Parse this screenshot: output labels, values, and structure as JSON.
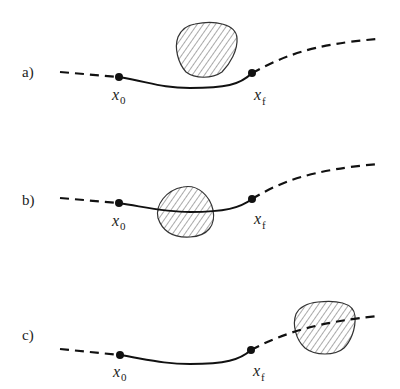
{
  "figure": {
    "panels": [
      {
        "label": "a)",
        "start_symbol": "x",
        "start_subscript": "0",
        "end_symbol": "x",
        "end_subscript": "f",
        "obstacle_position": "above segment, not intersecting"
      },
      {
        "label": "b)",
        "start_symbol": "x",
        "start_subscript": "0",
        "end_symbol": "x",
        "end_subscript": "f",
        "obstacle_position": "intersecting solid segment between x0 and xf"
      },
      {
        "label": "c)",
        "start_symbol": "x",
        "start_subscript": "0",
        "end_symbol": "x",
        "end_subscript": "f",
        "obstacle_position": "intersecting dashed continuation beyond xf"
      }
    ],
    "colors": {
      "line": "#111111",
      "obstacle_outline": "#333333",
      "hatch": "#555555",
      "background": "#ffffff"
    }
  }
}
